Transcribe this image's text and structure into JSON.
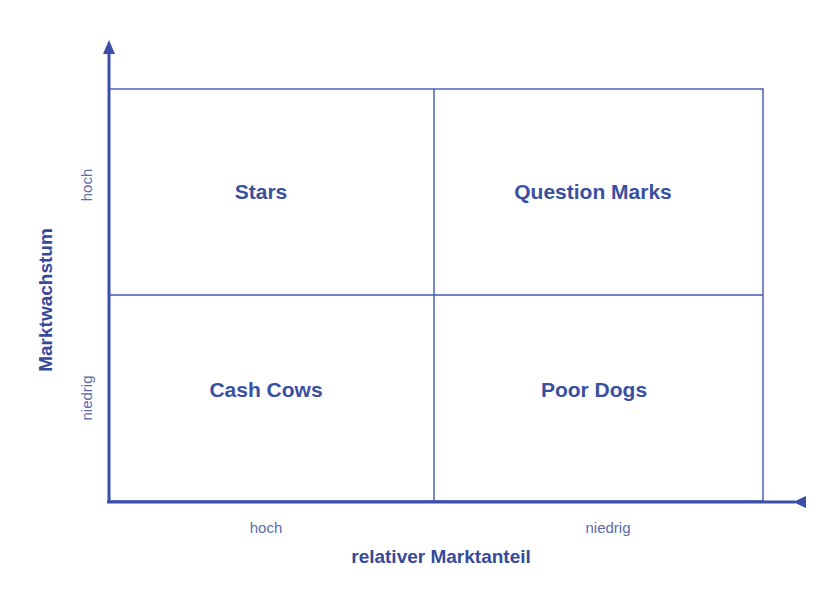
{
  "colors": {
    "line": "#3f56b0",
    "axis": "#3a4fa8",
    "quadrant_text": "#3b4f9f",
    "tick_text": "#5d6ca8",
    "axis_title_text": "#36499a"
  },
  "quadrants": {
    "top_left": "Stars",
    "top_right": "Question Marks",
    "bottom_left": "Cash Cows",
    "bottom_right": "Poor Dogs"
  },
  "y_axis": {
    "title": "Marktwachstum",
    "high_label": "hoch",
    "low_label": "niedrig"
  },
  "x_axis": {
    "title": "relativer Marktanteil",
    "left_label": "hoch",
    "right_label": "niedrig"
  }
}
